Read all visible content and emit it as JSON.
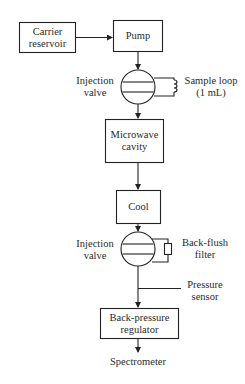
{
  "diagram": {
    "nodes": {
      "carrier_reservoir": {
        "line1": "Carrier",
        "line2": "reservoir"
      },
      "pump": {
        "label": "Pump"
      },
      "injection_valve_1": {
        "line1": "Injection",
        "line2": "valve"
      },
      "sample_loop": {
        "line1": "Sample loop",
        "line2": "(1 mL)"
      },
      "microwave_cavity": {
        "line1": "Microwave",
        "line2": "cavity"
      },
      "cool": {
        "label": "Cool"
      },
      "injection_valve_2": {
        "line1": "Injection",
        "line2": "valve"
      },
      "back_flush_filter": {
        "line1": "Back-flush",
        "line2": "filter"
      },
      "pressure_sensor": {
        "line1": "Pressure",
        "line2": "sensor"
      },
      "back_pressure_regulator": {
        "line1": "Back-pressure",
        "line2": "regulator"
      },
      "spectrometer": {
        "label": "Spectrometer"
      }
    },
    "edges": [
      [
        "carrier_reservoir",
        "pump"
      ],
      [
        "pump",
        "injection_valve_1"
      ],
      [
        "injection_valve_1",
        "microwave_cavity"
      ],
      [
        "microwave_cavity",
        "cool"
      ],
      [
        "cool",
        "injection_valve_2"
      ],
      [
        "injection_valve_2",
        "back_pressure_regulator"
      ],
      [
        "back_pressure_regulator",
        "spectrometer"
      ]
    ]
  }
}
